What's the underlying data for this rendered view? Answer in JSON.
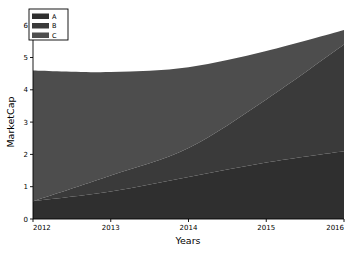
{
  "chart_data": {
    "type": "area",
    "stacked": true,
    "title": "",
    "xlabel": "Years",
    "ylabel": "MarketCap",
    "x": [
      2012,
      2013,
      2014,
      2015,
      2016
    ],
    "xticklabels": [
      "2012",
      "2013",
      "2014",
      "2015",
      "2016"
    ],
    "yticklabels": [
      "0",
      "1",
      "2",
      "3",
      "4",
      "5",
      "6"
    ],
    "yticks": [
      0,
      1,
      2,
      3,
      4,
      5,
      6
    ],
    "xlim": [
      2012,
      2016
    ],
    "ylim": [
      0,
      6.3
    ],
    "grid": false,
    "legend_position": "upper-left",
    "series": [
      {
        "name": "A",
        "color": "#2f2f2f",
        "values": [
          0.55,
          0.85,
          1.3,
          1.75,
          2.1
        ]
      },
      {
        "name": "B",
        "color": "#3a3a3a",
        "values": [
          0.0,
          0.5,
          0.9,
          1.95,
          3.3
        ]
      },
      {
        "name": "C",
        "color": "#4d4d4d",
        "values": [
          4.05,
          3.2,
          2.5,
          1.5,
          0.45
        ]
      }
    ],
    "cumulative_totals": [
      4.6,
      4.55,
      4.7,
      5.2,
      5.85
    ]
  },
  "legend": {
    "entries": [
      {
        "label": "A"
      },
      {
        "label": "B"
      },
      {
        "label": "C"
      }
    ]
  },
  "axes": {
    "x_title": "Years",
    "y_title": "MarketCap",
    "x_tick_0": "2012",
    "x_tick_1": "2013",
    "x_tick_2": "2014",
    "x_tick_3": "2015",
    "x_tick_4": "2016",
    "y_tick_0": "0",
    "y_tick_1": "1",
    "y_tick_2": "2",
    "y_tick_3": "3",
    "y_tick_4": "4",
    "y_tick_5": "5",
    "y_tick_6": "6"
  }
}
